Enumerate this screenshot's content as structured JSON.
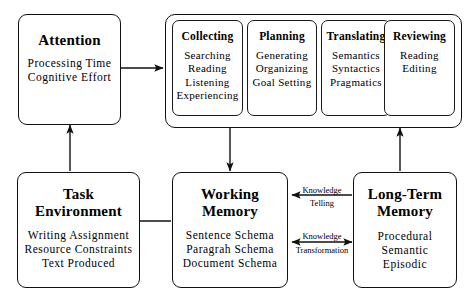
{
  "diagram": {
    "background_color": "#ffffff",
    "line_color": "#111111",
    "text_color": "#000000"
  },
  "nodes": {
    "attention": {
      "title": "Attention",
      "items": [
        "Processing Time",
        "Cognitive Effort"
      ]
    },
    "task_environment": {
      "title_line1": "Task",
      "title_line2": "Environment",
      "items": [
        "Writing Assignment",
        "Resource Constraints",
        "Text Produced"
      ]
    },
    "working_memory": {
      "title_line1": "Working",
      "title_line2": "Memory",
      "items": [
        "Sentence Schema",
        "Paragrah Schema",
        "Document Schema"
      ]
    },
    "long_term_memory": {
      "title_line1": "Long-Term",
      "title_line2": "Memory",
      "items": [
        "Procedural",
        "Semantic",
        "Episodic"
      ]
    }
  },
  "processes": [
    {
      "title": "Collecting",
      "items": [
        "Searching",
        "Reading",
        "Listening",
        "Experiencing"
      ]
    },
    {
      "title": "Planning",
      "items": [
        "Generating",
        "Organizing",
        "Goal Setting"
      ]
    },
    {
      "title": "Translating",
      "items": [
        "Semantics",
        "Syntactics",
        "Pragmatics"
      ]
    },
    {
      "title": "Reviewing",
      "items": [
        "Reading",
        "Editing"
      ]
    }
  ],
  "arrow_labels": {
    "knowledge_telling_line1": "Knowledge",
    "knowledge_telling_line2": "Telling",
    "knowledge_transformation_line1": "Knowledge",
    "knowledge_transformation_line2": "Transformation"
  },
  "arrows": [
    {
      "name": "attention-to-processes",
      "from": "attention",
      "to": "processes",
      "direction": "right"
    },
    {
      "name": "task-environment-to-attention",
      "from": "task_environment",
      "to": "attention",
      "direction": "up"
    },
    {
      "name": "processes-to-working-memory",
      "from": "processes",
      "to": "working_memory",
      "direction": "down"
    },
    {
      "name": "long-term-memory-to-processes",
      "from": "long_term_memory",
      "to": "processes",
      "direction": "up"
    },
    {
      "name": "working-memory-to-task-environment",
      "from": "working_memory",
      "to": "task_environment",
      "direction": "left"
    },
    {
      "name": "knowledge-telling",
      "from": "long_term_memory",
      "to": "working_memory",
      "direction": "left"
    },
    {
      "name": "knowledge-transformation",
      "from": "working_memory",
      "to": "long_term_memory",
      "direction": "both"
    }
  ]
}
